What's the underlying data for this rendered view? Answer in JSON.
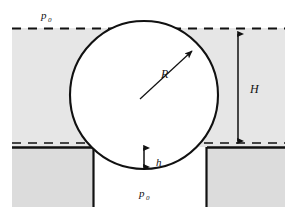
{
  "figure": {
    "type": "physics-diagram",
    "canvas": {
      "width": 297,
      "height": 216,
      "background": "#ffffff"
    }
  },
  "labels": {
    "pressure_top": {
      "symbol": "p",
      "subscript": "0",
      "x": 45,
      "y": 17
    },
    "pressure_bottom": {
      "symbol": "p",
      "subscript": "0",
      "x": 143,
      "y": 196
    },
    "radius": {
      "symbol": "R",
      "x": 166,
      "y": 75
    },
    "height_H": {
      "symbol": "H",
      "x": 256,
      "y": 90
    },
    "height_h": {
      "symbol": "h",
      "x": 163,
      "y": 165
    }
  },
  "geometry": {
    "sphere": {
      "cx": 144,
      "cy": 95,
      "r": 74,
      "fill": "#ffffff",
      "stroke": "#111111",
      "stroke_width": 2
    },
    "free_surface_line": {
      "y": 28,
      "x1": 12,
      "x2": 285,
      "style": "dashed"
    },
    "orifice_plane_line": {
      "y": 143,
      "x1": 12,
      "x2": 285,
      "style": "dashed"
    },
    "tank_bottom_line": {
      "y": 147,
      "x1": 12,
      "x2": 285,
      "style": "solid"
    },
    "orifice_left_edge_x": 93,
    "orifice_right_edge_x": 207,
    "liquid_region": {
      "x": 12,
      "y": 28,
      "width": 273,
      "height": 119,
      "fill": "#e6e6e6"
    },
    "wall_block_left": {
      "x": 12,
      "y": 147,
      "width": 81,
      "height": 60,
      "fill": "#dcdcdc"
    },
    "wall_block_right": {
      "x": 207,
      "y": 147,
      "width": 78,
      "height": 60,
      "fill": "#dcdcdc"
    },
    "radius_arrow": {
      "x1": 144,
      "y1": 95,
      "x2": 196,
      "y2": 48
    },
    "dimension_H": {
      "x": 238,
      "y1": 28,
      "y2": 147
    },
    "dimension_h": {
      "x": 144,
      "y1": 143,
      "y2": 172
    }
  },
  "colors": {
    "ink": "#111111",
    "liquid_fill": "#e6e6e6",
    "wall_fill": "#dcdcdc",
    "sphere_fill": "#ffffff",
    "page": "#ffffff"
  }
}
